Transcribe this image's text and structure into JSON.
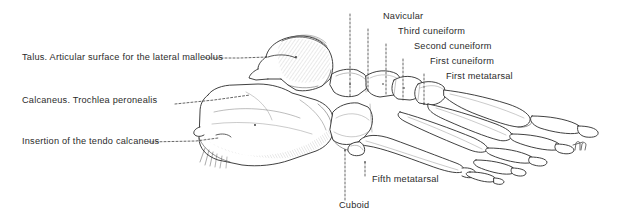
{
  "figure": {
    "kind": "anatomical-illustration",
    "background_color": "#ffffff",
    "ink_color": "#2b2b2b",
    "signature": "JH"
  },
  "labels": {
    "left": [
      {
        "id": "talus",
        "text": "Talus. Articular surface for the lateral malleolus",
        "x": 22,
        "y": 58,
        "anchor": "start"
      },
      {
        "id": "calcaneus-trochlea",
        "text": "Calcaneus. Trochlea peronealis",
        "x": 22,
        "y": 101,
        "anchor": "start"
      },
      {
        "id": "tendo-calcaneus",
        "text": "Insertion of the tendo calcaneus",
        "x": 22,
        "y": 142,
        "anchor": "start"
      }
    ],
    "top_right": [
      {
        "id": "navicular",
        "text": "Navicular",
        "x": 383,
        "y": 17,
        "anchor": "start"
      },
      {
        "id": "third-cuneiform",
        "text": "Third cuneiform",
        "x": 398,
        "y": 32,
        "anchor": "start"
      },
      {
        "id": "second-cuneiform",
        "text": "Second cuneiform",
        "x": 414,
        "y": 47,
        "anchor": "start"
      },
      {
        "id": "first-cuneiform",
        "text": "First cuneiform",
        "x": 430,
        "y": 62,
        "anchor": "start"
      },
      {
        "id": "first-metatarsal",
        "text": "First metatarsal",
        "x": 446,
        "y": 77,
        "anchor": "start"
      }
    ],
    "bottom": [
      {
        "id": "fifth-metatarsal",
        "text": "Fifth metatarsal",
        "x": 372,
        "y": 180,
        "anchor": "start"
      },
      {
        "id": "cuboid",
        "text": "Cuboid",
        "x": 339,
        "y": 206,
        "anchor": "start"
      }
    ]
  },
  "leaders": {
    "dotted_style": "2,2",
    "left": [
      {
        "id": "leader-talus",
        "d": "M 205 58 L 240 58 L 268 57"
      },
      {
        "id": "leader-calcaneus-trochlea",
        "d": "M 175 104 L 214 100 L 250 95"
      },
      {
        "id": "leader-tendo-calcaneus",
        "d": "M 148 142 L 196 141 L 218 138"
      }
    ],
    "vertical": [
      {
        "id": "leader-navicular",
        "d": "M 350 14 L 350 96"
      },
      {
        "id": "leader-third-cuneiform",
        "d": "M 368 29 L 368 92"
      },
      {
        "id": "leader-second-cuneiform",
        "d": "M 386 44 L 386 96"
      },
      {
        "id": "leader-first-cuneiform",
        "d": "M 403 59 L 403 100"
      },
      {
        "id": "leader-first-metatarsal",
        "d": "M 424 74 L 424 104"
      },
      {
        "id": "leader-fifth-metatarsal",
        "d": "M 365 162 L 365 176"
      },
      {
        "id": "leader-cuboid",
        "d": "M 345 150 L 345 202"
      }
    ]
  },
  "bones": {
    "talus": {
      "name": "Talus"
    },
    "calcaneus": {
      "name": "Calcaneus"
    },
    "navicular": {
      "name": "Navicular"
    },
    "cuboid": {
      "name": "Cuboid"
    },
    "cuneiforms": {
      "name": "Cuneiform bones"
    },
    "metatarsals": {
      "name": "Metatarsal bones"
    },
    "phalanges": {
      "name": "Phalanges"
    }
  }
}
